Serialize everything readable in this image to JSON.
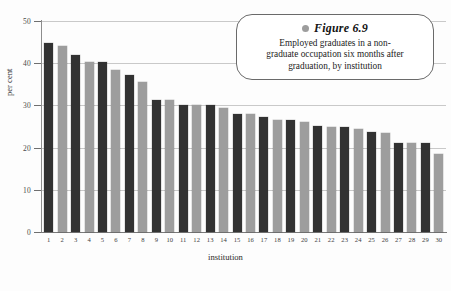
{
  "caption": {
    "figure_label": "Figure 6.9",
    "lines": [
      "Employed graduates in a non-",
      "graduate occupation six months after",
      "graduation, by institution"
    ],
    "bullet_color": "#9d9d9d"
  },
  "axes": {
    "y_title": "per cent",
    "x_title": "institution",
    "y_ticks": [
      "0",
      "10",
      "20",
      "30",
      "40",
      "50"
    ]
  },
  "colors": {
    "bar_dark": "#323232",
    "bar_light": "#9d9d9d",
    "gridline": "#c9c9c9",
    "axis": "#7a7a7a"
  },
  "chart_data": {
    "type": "bar",
    "title": "Figure 6.9",
    "subtitle": "Employed graduates in a non-graduate occupation six months after graduation, by institution",
    "xlabel": "institution",
    "ylabel": "per cent",
    "ylim": [
      0,
      50
    ],
    "yticks": [
      0,
      10,
      20,
      30,
      40,
      50
    ],
    "grid": true,
    "legend": "none",
    "categories": [
      "1",
      "2",
      "3",
      "4",
      "5",
      "6",
      "7",
      "8",
      "9",
      "10",
      "11",
      "12",
      "13",
      "14",
      "15",
      "16",
      "17",
      "18",
      "19",
      "20",
      "21",
      "22",
      "23",
      "24",
      "25",
      "26",
      "27",
      "28",
      "29",
      "30"
    ],
    "values": [
      44.8,
      44.0,
      42.0,
      40.2,
      40.2,
      38.4,
      37.2,
      35.6,
      31.2,
      31.2,
      30.2,
      30.2,
      30.2,
      29.4,
      28.0,
      28.0,
      27.2,
      26.6,
      26.6,
      26.0,
      25.2,
      25.0,
      25.0,
      24.4,
      23.6,
      23.4,
      21.2,
      21.2,
      21.0,
      18.4
    ],
    "bar_shades": [
      "dark",
      "light",
      "dark",
      "light",
      "dark",
      "light",
      "dark",
      "light",
      "dark",
      "light",
      "dark",
      "light",
      "dark",
      "light",
      "dark",
      "light",
      "dark",
      "light",
      "dark",
      "light",
      "dark",
      "light",
      "dark",
      "light",
      "dark",
      "light",
      "dark",
      "light",
      "dark",
      "light"
    ]
  }
}
